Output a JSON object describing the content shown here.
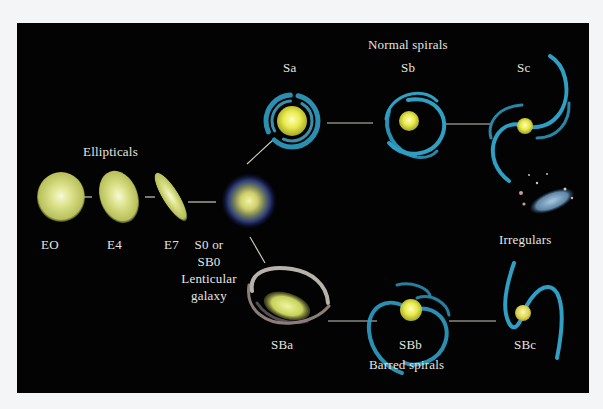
{
  "diagram": {
    "colors": {
      "background": "#030303",
      "label": "#e6e6e0",
      "connector": "#c9c7bd",
      "elliptical_core": "#f3f7c8",
      "elliptical_body": "#c9cf6a",
      "spiral_arm": "#2f9fc4",
      "spiral_core": "#f1f25a",
      "lenticular_halo": "#2a3a7a",
      "barred_a_arm": "#d8d2c8"
    },
    "groups": {
      "ellipticals": "Ellipticals",
      "normal_spirals": "Normal   spirals",
      "barred_spirals": "Barred   spirals",
      "irregulars": "Irregulars"
    },
    "nodes": {
      "e0": {
        "label": "EO",
        "type": "elliptical"
      },
      "e4": {
        "label": "E4",
        "type": "elliptical"
      },
      "e7": {
        "label": "E7",
        "type": "elliptical"
      },
      "s0": {
        "label_line1": "S0   or",
        "label_line2": "SB0",
        "label_line3": "Lenticular",
        "label_line4": "galaxy",
        "type": "lenticular"
      },
      "sa": {
        "label": "Sa",
        "type": "normal-spiral"
      },
      "sb": {
        "label": "Sb",
        "type": "normal-spiral"
      },
      "sc": {
        "label": "Sc",
        "type": "normal-spiral"
      },
      "sba": {
        "label": "SBa",
        "type": "barred-spiral"
      },
      "sbb": {
        "label": "SBb",
        "type": "barred-spiral"
      },
      "sbc": {
        "label": "SBc",
        "type": "barred-spiral"
      },
      "irr": {
        "type": "irregular"
      }
    },
    "edges": [
      [
        "E0",
        "E4"
      ],
      [
        "E4",
        "E7"
      ],
      [
        "E7",
        "S0"
      ],
      [
        "S0",
        "Sa"
      ],
      [
        "Sa",
        "Sb"
      ],
      [
        "Sb",
        "Sc"
      ],
      [
        "S0",
        "SBa"
      ],
      [
        "SBa",
        "SBb"
      ],
      [
        "SBb",
        "SBc"
      ]
    ]
  }
}
